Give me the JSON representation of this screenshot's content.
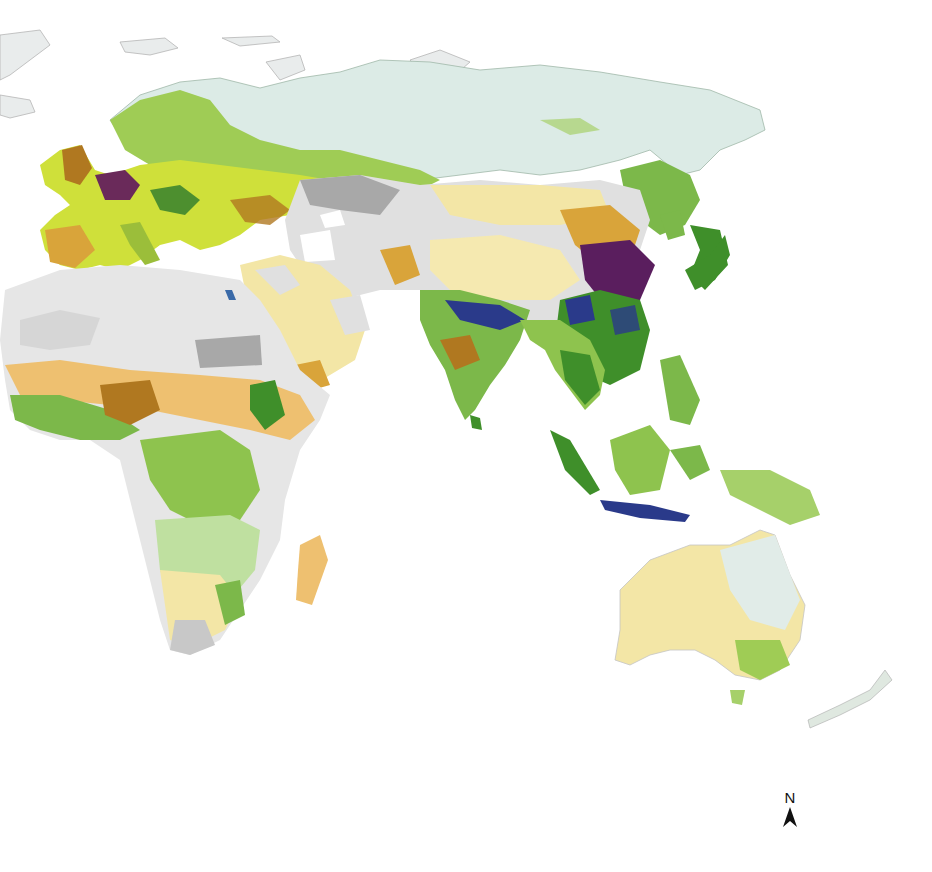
{
  "map": {
    "projection": "Eastern hemisphere world map (Europe, Africa, Asia, Oceania)",
    "background": "#ffffff",
    "north_arrow": {
      "label": "N",
      "icon": "north-arrow-icon"
    },
    "palette": {
      "water": "#ffffff",
      "ice_tundra": "#e6eeec",
      "boreal_light_cyan": "#dcebe6",
      "barren_grey": "#a8a8a8",
      "desert_light": "#e6e6e6",
      "sparse_pale_yellow": "#f3e6a6",
      "dry_orange": "#eec070",
      "cropland_yellow_green": "#cfe03a",
      "forest_green": "#8ec34e",
      "dense_green": "#3f8f2a",
      "intensive_brown": "#b07820",
      "very_intensive_purple": "#5a1e5e",
      "irrigated_blue": "#2a3a8a"
    }
  }
}
